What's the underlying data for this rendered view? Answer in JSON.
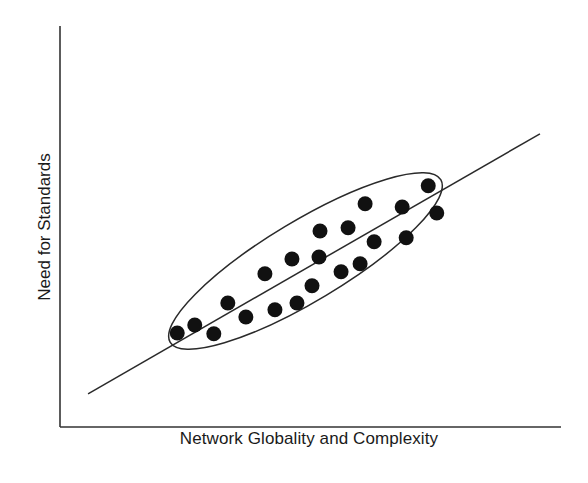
{
  "chart_data": {
    "type": "scatter",
    "title": "",
    "xlabel": "Network Globality and Complexity",
    "ylabel": "Need for Standards",
    "xlim": [
      0,
      100
    ],
    "ylim": [
      0,
      100
    ],
    "grid": false,
    "ticks": false,
    "legend": null,
    "series": [
      {
        "name": "observations",
        "marker": "filled-circle",
        "color": "#111111",
        "points": [
          {
            "x": 23.4,
            "y": 23.5
          },
          {
            "x": 26.9,
            "y": 25.5
          },
          {
            "x": 30.7,
            "y": 23.3
          },
          {
            "x": 33.5,
            "y": 31.0
          },
          {
            "x": 37.1,
            "y": 27.5
          },
          {
            "x": 40.9,
            "y": 38.3
          },
          {
            "x": 42.9,
            "y": 29.3
          },
          {
            "x": 46.3,
            "y": 42.0
          },
          {
            "x": 47.3,
            "y": 31.0
          },
          {
            "x": 50.3,
            "y": 35.3
          },
          {
            "x": 51.9,
            "y": 49.0
          },
          {
            "x": 51.7,
            "y": 42.5
          },
          {
            "x": 56.1,
            "y": 38.8
          },
          {
            "x": 57.5,
            "y": 49.8
          },
          {
            "x": 59.9,
            "y": 40.8
          },
          {
            "x": 60.9,
            "y": 55.8
          },
          {
            "x": 62.7,
            "y": 46.3
          },
          {
            "x": 68.3,
            "y": 55.0
          },
          {
            "x": 69.1,
            "y": 47.3
          },
          {
            "x": 73.5,
            "y": 60.3
          },
          {
            "x": 75.2,
            "y": 53.5
          }
        ]
      }
    ],
    "trend_line": {
      "x1": 5.6,
      "y1": 8.3,
      "x2": 95.8,
      "y2": 73.3
    },
    "annotations": [
      {
        "type": "ellipse",
        "description": "cluster enclosing all points",
        "cx": 49.0,
        "cy": 41.5,
        "rx": 31.5,
        "ry": 8.0,
        "rotation_deg": -31
      }
    ]
  },
  "layout": {
    "plot_px": {
      "left": 60,
      "right": 561,
      "top": 27,
      "bottom": 427
    }
  }
}
